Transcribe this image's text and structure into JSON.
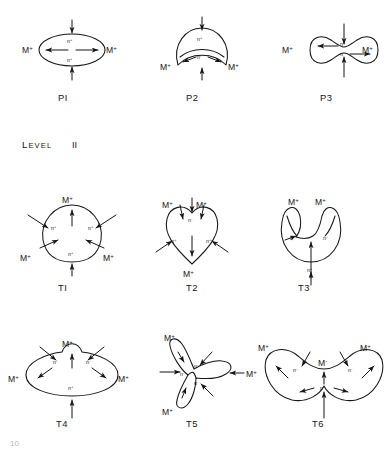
{
  "figure": {
    "title_fragment": "10",
    "section_label": {
      "word": "LEVEL",
      "numeral": "II"
    },
    "charge_label": "M",
    "charge_sup": "+",
    "node_pos": "n",
    "node_pos_sup": "+",
    "node_neg": "n",
    "node_neg_sup": "-"
  },
  "rows": [
    {
      "row_name": "level-one-row",
      "shapes": [
        {
          "id": "P1",
          "caption": "PI",
          "shape": "ellipse",
          "charges": [
            "M+",
            "M+"
          ],
          "interior_nodes": [
            "n+",
            "n+"
          ],
          "arrows": {
            "horizontal": "outward",
            "vertical": "inward"
          }
        },
        {
          "id": "P2",
          "caption": "P2",
          "shape": "crescent",
          "charges": [
            "M+",
            "M+"
          ],
          "interior_nodes": [
            "n+",
            "n-"
          ],
          "arrows": {
            "horizontal": "inward",
            "vertical": "inward"
          }
        },
        {
          "id": "P3",
          "caption": "P3",
          "shape": "peanut",
          "charges": [
            "M+",
            "M+"
          ],
          "interior_nodes": [
            "n+",
            "n-"
          ],
          "arrows": {
            "horizontal": "outward",
            "vertical": "inward"
          }
        }
      ]
    },
    {
      "row_name": "level-two-row-one",
      "shapes": [
        {
          "id": "T1",
          "caption": "TI",
          "shape": "rounded-triangle",
          "charges": [
            "M+",
            "M+",
            "M+"
          ],
          "interior_nodes": [
            "n+",
            "n+",
            "n+"
          ],
          "arrows": {
            "diagonal": "inward",
            "vertical": "inward"
          }
        },
        {
          "id": "T2",
          "caption": "T2",
          "shape": "heart",
          "charges": [
            "M+",
            "M+",
            "M+"
          ],
          "interior_nodes": [
            "n-",
            "n+",
            "n+"
          ],
          "arrows": {
            "diagonal": "inward",
            "vertical": "inward"
          }
        },
        {
          "id": "T3",
          "caption": "T3",
          "shape": "notched-disc",
          "charges": [
            "M+",
            "M+"
          ],
          "interior_nodes": [
            "n-",
            "n-",
            "n+"
          ],
          "arrows": {
            "vertical": "inward"
          }
        }
      ]
    },
    {
      "row_name": "level-two-row-two",
      "shapes": [
        {
          "id": "T4",
          "caption": "T4",
          "shape": "bumped-oval",
          "charges": [
            "M+",
            "M+",
            "M+"
          ],
          "interior_nodes": [
            "n-",
            "n-",
            "n+"
          ],
          "arrows": {
            "diagonal": "inward",
            "vertical": "inward"
          }
        },
        {
          "id": "T5",
          "caption": "T5",
          "shape": "trilobe",
          "charges": [
            "M+",
            "M+",
            "M+"
          ],
          "interior_nodes": [
            "n-",
            "n-",
            "n-"
          ],
          "arrows": {
            "diagonal": "inward",
            "horizontal": "inward"
          }
        },
        {
          "id": "T6",
          "caption": "T6",
          "shape": "saddle",
          "charges": [
            "M+",
            "M+",
            "M+"
          ],
          "interior_nodes": [
            "n-",
            "n-",
            "n-"
          ],
          "arrows": {
            "diagonal": "inward",
            "vertical": "inward"
          }
        }
      ]
    }
  ],
  "colors": {
    "ink": "#151515",
    "paper": "#ffffff"
  }
}
